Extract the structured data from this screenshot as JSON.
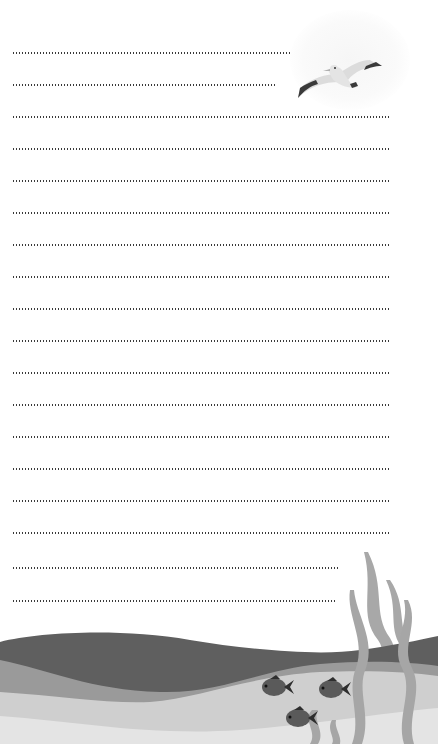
{
  "page": {
    "type": "lined-stationery",
    "theme": "ocean",
    "colors": {
      "background": "#ffffff",
      "dots": "#3a3a3a",
      "wave_dark": "#5f5f5f",
      "wave_mid": "#9a9a9a",
      "wave_light": "#cfcfcf",
      "sand": "#e6e6e6",
      "seaweed": "#a6a6a6",
      "fish": "#5a5a5a",
      "bird_body": "#dcdcdc",
      "bird_wingtip": "#3a3a3a"
    }
  },
  "lines": [
    {
      "top": 52,
      "width": 280
    },
    {
      "top": 84,
      "width": 265
    },
    {
      "top": 116,
      "width": 378
    },
    {
      "top": 148,
      "width": 378
    },
    {
      "top": 180,
      "width": 378
    },
    {
      "top": 212,
      "width": 378
    },
    {
      "top": 244,
      "width": 378
    },
    {
      "top": 276,
      "width": 378
    },
    {
      "top": 308,
      "width": 378
    },
    {
      "top": 340,
      "width": 378
    },
    {
      "top": 372,
      "width": 378
    },
    {
      "top": 404,
      "width": 378
    },
    {
      "top": 436,
      "width": 378
    },
    {
      "top": 468,
      "width": 378
    },
    {
      "top": 500,
      "width": 378
    },
    {
      "top": 532,
      "width": 378
    },
    {
      "top": 567,
      "width": 328
    },
    {
      "top": 600,
      "width": 323
    }
  ],
  "illustrations": {
    "top_right": "seagull-flying",
    "bottom": [
      "ocean-waves",
      "fish",
      "fish",
      "fish",
      "seaweed"
    ]
  }
}
